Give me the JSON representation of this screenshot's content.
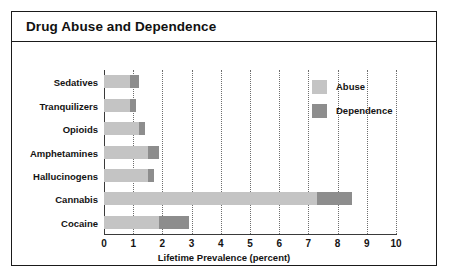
{
  "figure": {
    "title": "Drug Abuse and Dependence"
  },
  "legend": {
    "position": "inside-top-right",
    "items": [
      {
        "label": "Abuse",
        "color": "#c4c4c4"
      },
      {
        "label": "Dependence",
        "color": "#8d8d8d"
      }
    ]
  },
  "chart_data": {
    "type": "bar",
    "orientation": "horizontal",
    "stacked": true,
    "title": "Drug Abuse and Dependence",
    "xlabel": "Lifetime Prevalence (percent)",
    "ylabel": "",
    "xlim": [
      0,
      10
    ],
    "xticks": [
      0,
      1,
      2,
      3,
      4,
      5,
      6,
      7,
      8,
      9,
      10
    ],
    "xticklabels": [
      "0",
      "1",
      "2",
      "3",
      "4",
      "5",
      "6",
      "7",
      "8",
      "9",
      "10"
    ],
    "grid": "vertical-dotted",
    "categories": [
      "Sedatives",
      "Tranquilizers",
      "Opioids",
      "Amphetamines",
      "Hallucinogens",
      "Cannabis",
      "Cocaine"
    ],
    "series": [
      {
        "name": "Abuse",
        "color": "#c4c4c4",
        "values": [
          0.9,
          0.9,
          1.2,
          1.5,
          1.5,
          7.3,
          1.9
        ]
      },
      {
        "name": "Dependence",
        "color": "#8d8d8d",
        "values": [
          0.3,
          0.2,
          0.2,
          0.4,
          0.2,
          1.2,
          1.0
        ]
      }
    ],
    "totals": [
      1.2,
      1.1,
      1.4,
      1.9,
      1.7,
      8.5,
      2.9
    ]
  }
}
